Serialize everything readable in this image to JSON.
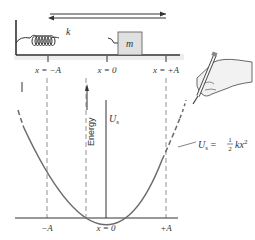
{
  "spring_system": {
    "spring_label": "k",
    "mass_label": "m",
    "positions": [
      "x = −A",
      "x = 0",
      "x = +A"
    ]
  },
  "graph": {
    "y_axis_label": "Energy",
    "curve_label_top": "U",
    "curve_label_top_sub": "s",
    "equation": {
      "lhs": "U",
      "lhs_sub": "s",
      "eq": " = ",
      "frac_num": "1",
      "frac_den": "2",
      "rhs": "kx",
      "rhs_sup": "2"
    },
    "x_ticks": [
      "−A",
      "x = 0",
      "+A"
    ]
  },
  "colors": {
    "curve": "#6b6b6b",
    "axis": "#333333",
    "dash": "#777777",
    "mass_fill": "#e0e0e0",
    "hand_fill": "#f2f2f2"
  }
}
